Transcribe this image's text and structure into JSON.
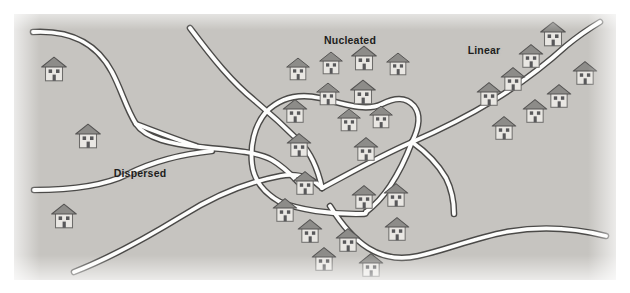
{
  "diagram": {
    "type": "schematic-map",
    "canvas": {
      "width": 630,
      "height": 293
    },
    "colors": {
      "background": "#c6c4c0",
      "page": "#ffffff",
      "road_fill": "#fdfdfc",
      "road_outline": "#4b4a48",
      "house_wall": "#e9e7e3",
      "house_wall_outline": "#6d6c6a",
      "house_roof": "#8d8c89",
      "house_roof_outline": "#545352",
      "house_opening": "#58585a",
      "label_text": "#201d1c"
    },
    "labels": [
      {
        "name": "dispersed",
        "text": "Dispersed",
        "x": 140,
        "y": 173
      },
      {
        "name": "nucleated",
        "text": "Nucleated",
        "x": 350,
        "y": 40
      },
      {
        "name": "linear",
        "text": "Linear",
        "x": 484,
        "y": 50
      }
    ],
    "roads": [
      {
        "name": "road-northwest-to-hub",
        "path": "M 33 32 C 70 30 96 42 112 72 C 122 91 126 108 136 124 C 146 139 172 144 200 147 C 232 150 258 152 272 160 C 286 168 294 178 302 186"
      },
      {
        "name": "road-west-lower-to-hub",
        "path": "M 34 190 C 70 190 104 186 128 174 C 152 162 182 154 212 151"
      },
      {
        "name": "road-hub-spur-west",
        "path": "M 136 124 C 152 130 172 138 196 146"
      },
      {
        "name": "road-north-diagonal",
        "path": "M 190 28 C 214 60 232 82 254 100 C 272 115 288 130 300 142 C 312 154 318 170 322 188"
      },
      {
        "name": "road-ring-north",
        "path": "M 266 112 C 282 96 302 94 320 98 C 344 104 366 112 382 104 C 396 97 406 97 414 106 C 422 116 418 130 412 142"
      },
      {
        "name": "road-ring-east",
        "path": "M 412 142 C 406 158 398 174 390 186 C 382 198 374 206 366 212"
      },
      {
        "name": "road-ring-west",
        "path": "M 266 112 C 254 126 250 146 252 164 C 254 182 266 194 280 202"
      },
      {
        "name": "road-ring-south",
        "path": "M 280 202 C 300 210 330 214 356 214 C 366 214 366 214 366 212"
      },
      {
        "name": "road-hub-to-east",
        "path": "M 322 188 C 352 172 380 156 410 143 C 440 130 468 116 494 100 C 520 84 544 66 566 46 C 578 36 590 28 600 22"
      },
      {
        "name": "road-south-long",
        "path": "M 74 272 C 110 258 146 238 182 216 C 214 196 248 182 280 176 C 296 173 310 176 322 188"
      },
      {
        "name": "road-southeast-sweep",
        "path": "M 330 206 C 340 222 352 238 368 248 C 384 258 400 260 418 256 C 446 250 474 238 506 232 C 540 226 574 228 606 236"
      },
      {
        "name": "road-east-branch",
        "path": "M 412 142 C 426 152 438 164 446 178 C 452 190 454 202 454 214"
      }
    ],
    "houses": [
      {
        "group": "dispersed",
        "x": 54,
        "y": 68,
        "scale": 1.0
      },
      {
        "group": "dispersed",
        "x": 88,
        "y": 135,
        "scale": 1.0
      },
      {
        "group": "dispersed",
        "x": 64,
        "y": 215,
        "scale": 1.0
      },
      {
        "group": "nucleated",
        "x": 298,
        "y": 68,
        "scale": 0.92
      },
      {
        "group": "nucleated",
        "x": 331,
        "y": 62,
        "scale": 0.92
      },
      {
        "group": "nucleated",
        "x": 364,
        "y": 57,
        "scale": 1.0
      },
      {
        "group": "nucleated",
        "x": 398,
        "y": 63,
        "scale": 0.92
      },
      {
        "group": "nucleated",
        "x": 328,
        "y": 93,
        "scale": 0.92
      },
      {
        "group": "nucleated",
        "x": 363,
        "y": 91,
        "scale": 1.0
      },
      {
        "group": "nucleated",
        "x": 295,
        "y": 110,
        "scale": 0.96
      },
      {
        "group": "nucleated",
        "x": 349,
        "y": 119,
        "scale": 0.92
      },
      {
        "group": "nucleated",
        "x": 381,
        "y": 116,
        "scale": 0.92
      },
      {
        "group": "nucleated",
        "x": 299,
        "y": 144,
        "scale": 0.96
      },
      {
        "group": "nucleated",
        "x": 366,
        "y": 148,
        "scale": 0.96
      },
      {
        "group": "nucleated",
        "x": 305,
        "y": 182,
        "scale": 0.96
      },
      {
        "group": "nucleated",
        "x": 285,
        "y": 209,
        "scale": 0.96
      },
      {
        "group": "nucleated",
        "x": 364,
        "y": 196,
        "scale": 0.96
      },
      {
        "group": "nucleated",
        "x": 396,
        "y": 194,
        "scale": 0.96
      },
      {
        "group": "nucleated",
        "x": 397,
        "y": 228,
        "scale": 0.96
      },
      {
        "group": "nucleated",
        "x": 310,
        "y": 230,
        "scale": 0.96
      },
      {
        "group": "nucleated",
        "x": 348,
        "y": 239,
        "scale": 0.96
      },
      {
        "group": "nucleated",
        "x": 324,
        "y": 258,
        "scale": 0.96
      },
      {
        "group": "nucleated",
        "x": 371,
        "y": 264,
        "scale": 0.96
      },
      {
        "group": "linear",
        "x": 553,
        "y": 33,
        "scale": 1.0
      },
      {
        "group": "linear",
        "x": 531,
        "y": 55,
        "scale": 0.96
      },
      {
        "group": "linear",
        "x": 585,
        "y": 72,
        "scale": 0.96
      },
      {
        "group": "linear",
        "x": 513,
        "y": 78,
        "scale": 0.96
      },
      {
        "group": "linear",
        "x": 559,
        "y": 95,
        "scale": 0.96
      },
      {
        "group": "linear",
        "x": 489,
        "y": 93,
        "scale": 0.96
      },
      {
        "group": "linear",
        "x": 535,
        "y": 110,
        "scale": 0.96
      },
      {
        "group": "linear",
        "x": 504,
        "y": 127,
        "scale": 0.96
      }
    ]
  }
}
